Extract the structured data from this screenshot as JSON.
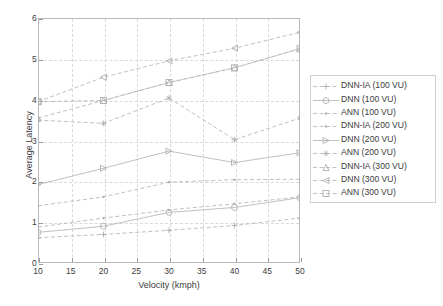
{
  "chart_data": {
    "type": "line",
    "title": "",
    "xlabel": "Velocity (kmph)",
    "ylabel": "Average Latency",
    "x": [
      10,
      20,
      30,
      40,
      50
    ],
    "xlim": [
      10,
      50
    ],
    "ylim": [
      0,
      6
    ],
    "xticks": [
      10,
      15,
      20,
      25,
      30,
      35,
      40,
      45,
      50
    ],
    "yticks": [
      0,
      1,
      2,
      3,
      4,
      5,
      6
    ],
    "grid": true,
    "legend_position": "right",
    "series": [
      {
        "name": "DNN-IA (100 VU)",
        "marker": "plus",
        "values": [
          0.62,
          0.7,
          0.8,
          0.92,
          1.1
        ]
      },
      {
        "name": "DNN (100 VU)",
        "marker": "circle",
        "values": [
          0.75,
          0.9,
          1.24,
          1.36,
          1.6
        ]
      },
      {
        "name": "ANN (100 VU)",
        "marker": "dot",
        "values": [
          1.4,
          1.62,
          1.98,
          2.04,
          2.05
        ]
      },
      {
        "name": "DNN-IA (200 VU)",
        "marker": "dot",
        "values": [
          0.88,
          1.1,
          1.3,
          1.45,
          1.62
        ]
      },
      {
        "name": "DNN (200 VU)",
        "marker": "triangle-right",
        "values": [
          1.92,
          2.32,
          2.74,
          2.46,
          2.7
        ]
      },
      {
        "name": "ANN (200 VU)",
        "marker": "star",
        "values": [
          3.5,
          3.42,
          4.04,
          3.02,
          3.55
        ]
      },
      {
        "name": "DNN-IA (300 VU)",
        "marker": "triangle-up",
        "values": [
          3.55,
          3.98,
          4.42,
          4.78,
          5.25
        ]
      },
      {
        "name": "DNN (300 VU)",
        "marker": "triangle-left",
        "values": [
          3.95,
          4.55,
          4.95,
          5.26,
          5.65
        ]
      },
      {
        "name": "ANN (300 VU)",
        "marker": "square",
        "values": [
          3.95,
          3.98,
          4.42,
          4.78,
          5.25
        ]
      }
    ]
  },
  "colors": {
    "axis": "#b9b9b9",
    "grid": "#d9d9d9",
    "text": "#3c3c3c",
    "series": "#b0b0b0"
  }
}
